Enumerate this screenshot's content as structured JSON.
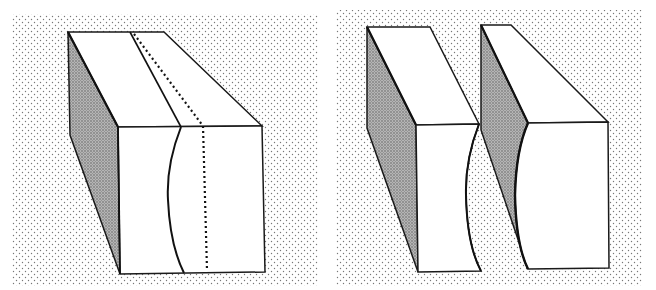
{
  "figure": {
    "panels": [
      {
        "id": "left",
        "label": "intact-block-with-fracture",
        "elements": [
          "block",
          "shaded-side-face",
          "curved-fracture-line",
          "dotted-reference-line"
        ]
      },
      {
        "id": "right",
        "label": "separated-blocks",
        "elements": [
          "block-a-convex-face",
          "block-b-concave-face"
        ]
      }
    ],
    "colors": {
      "background": "#ffffff",
      "stipple": "#8a8a8a",
      "shade": "#9c9c9c",
      "line": "#1a1a1a",
      "face": "#ffffff"
    }
  }
}
